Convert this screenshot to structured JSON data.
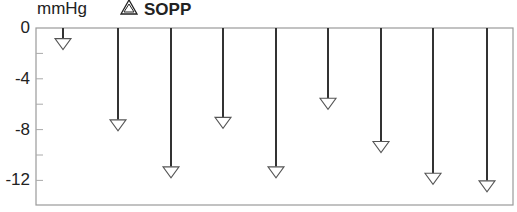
{
  "chart_data": {
    "type": "bar",
    "style": "downward arrows from zero",
    "title": "",
    "unit_label": "mmHg",
    "legend": [
      {
        "name": "SOPP",
        "marker": "open-triangle-down-arrow"
      }
    ],
    "xlabel": "",
    "ylabel": "mmHg",
    "ylim": [
      -14,
      0
    ],
    "yticks": [
      0,
      -4,
      -8,
      -12
    ],
    "minor_yticks": [
      -2,
      -6,
      -10
    ],
    "categories": [
      "1",
      "2",
      "3",
      "4",
      "5",
      "6",
      "7",
      "8",
      "9"
    ],
    "series": [
      {
        "name": "SOPP",
        "values": [
          -1.7,
          -8.1,
          -11.8,
          -7.9,
          -11.8,
          -6.4,
          -9.8,
          -12.3,
          -12.9
        ]
      }
    ],
    "grid": false
  },
  "labels": {
    "unit": "mmHg",
    "legend_label": "SOPP",
    "legend_symbol": "△",
    "y0": "0",
    "y1": "-4",
    "y2": "-8",
    "y3": "-12"
  }
}
